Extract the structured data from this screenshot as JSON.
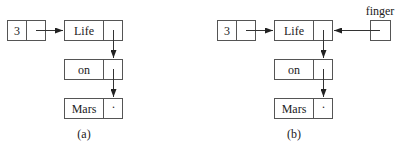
{
  "diagrams": [
    {
      "caption": "(a)",
      "header_node": {
        "count": "3"
      },
      "nodes": [
        {
          "value": "Life",
          "next": "pointer"
        },
        {
          "value": "on",
          "next": "pointer"
        },
        {
          "value": "Mars",
          "next": "null-dot"
        }
      ],
      "null_marker": "·"
    },
    {
      "caption": "(b)",
      "header_node": {
        "count": "3"
      },
      "nodes": [
        {
          "value": "Life",
          "next": "pointer"
        },
        {
          "value": "on",
          "next": "pointer"
        },
        {
          "value": "Mars",
          "next": "null-dot"
        }
      ],
      "null_marker": "·",
      "external_pointer": {
        "label": "finger",
        "points_to": "Life"
      }
    }
  ]
}
